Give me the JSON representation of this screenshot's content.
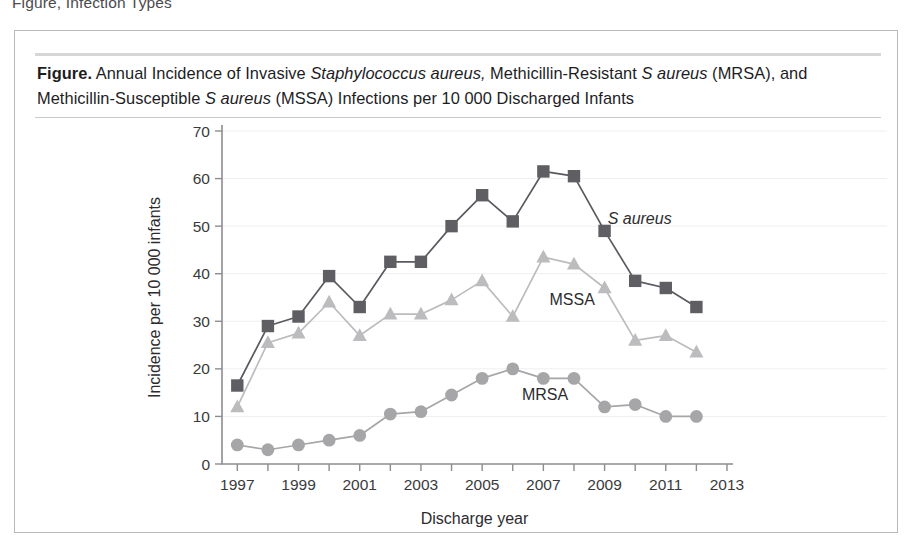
{
  "running_head": "Figure, Infection Types",
  "caption": {
    "bold_prefix": "Figure.",
    "line1_part1": " Annual Incidence of Invasive ",
    "line1_italic1": "Staphylococcus aureus,",
    "line1_part2": " Methicillin-Resistant ",
    "line1_italic2": "S aureus",
    "line1_part3": " (MRSA),",
    "line2_part1": "and Methicillin-Susceptible ",
    "line2_italic1": "S aureus",
    "line2_part2": " (MSSA) Infections per 10 000 Discharged Infants",
    "full_text": "Figure. Annual Incidence of Invasive Staphylococcus aureus, Methicillin-Resistant S aureus (MRSA), and Methicillin-Susceptible S aureus (MSSA) Infections per 10 000 Discharged Infants"
  },
  "chart_data": {
    "type": "line",
    "title": "",
    "xlabel": "Discharge year",
    "ylabel": "Incidence per 10 000 infants",
    "x": [
      1997,
      1998,
      1999,
      2000,
      2001,
      2002,
      2003,
      2004,
      2005,
      2006,
      2007,
      2008,
      2009,
      2010,
      2011,
      2012
    ],
    "xlim": [
      1996.5,
      2013
    ],
    "ylim": [
      0,
      70
    ],
    "xticks": [
      1997,
      1998,
      1999,
      2000,
      2001,
      2002,
      2003,
      2004,
      2005,
      2006,
      2007,
      2008,
      2009,
      2010,
      2011,
      2012,
      2013
    ],
    "xtick_labels": [
      "1997",
      "",
      "1999",
      "",
      "2001",
      "",
      "2003",
      "",
      "2005",
      "",
      "2007",
      "",
      "2009",
      "",
      "2011",
      "",
      "2013"
    ],
    "yticks": [
      0,
      10,
      20,
      30,
      40,
      50,
      60,
      70
    ],
    "ytick_labels": [
      "0",
      "10",
      "20",
      "30",
      "40",
      "50",
      "60",
      "70"
    ],
    "grid": "horizontal-faint",
    "legend_position": "inline-annotations",
    "series": [
      {
        "name": "S aureus",
        "label_italic": true,
        "marker": "square",
        "color": "#5e5e63",
        "line_color": "#595960",
        "label_x": 2009.1,
        "label_y": 50.5,
        "values": [
          16.5,
          29.0,
          31.0,
          39.5,
          33.0,
          42.5,
          42.5,
          50.0,
          56.5,
          51.0,
          61.5,
          60.5,
          49.0,
          38.5,
          37.0,
          33.0
        ]
      },
      {
        "name": "MSSA",
        "label_italic": false,
        "marker": "triangle",
        "color": "#bcbcbe",
        "line_color": "#bcbcbe",
        "label_x": 2007.2,
        "label_y": 33.5,
        "values": [
          12.0,
          25.5,
          27.5,
          34.0,
          27.0,
          31.5,
          31.5,
          34.5,
          38.5,
          31.0,
          43.5,
          42.0,
          37.0,
          26.0,
          27.0,
          23.5
        ]
      },
      {
        "name": "MRSA",
        "label_italic": false,
        "marker": "circle",
        "color": "#a6a6a8",
        "line_color": "#a6a6a8",
        "label_x": 2006.3,
        "label_y": 13.5,
        "values": [
          4.0,
          3.0,
          4.0,
          5.0,
          6.0,
          10.5,
          11.0,
          14.5,
          18.0,
          20.0,
          18.0,
          18.0,
          12.0,
          12.5,
          10.0,
          10.0
        ]
      }
    ]
  },
  "colors": {
    "frame_border": "#b9b9bb",
    "caption_rule": "#d6d6d8",
    "axis": "#8d8d8f",
    "grid": "#efeff0",
    "s_aureus": "#5e5e63",
    "mssa": "#bcbcbe",
    "mrsa": "#a6a6a8",
    "background": "#ffffff",
    "text": "#231f20"
  }
}
